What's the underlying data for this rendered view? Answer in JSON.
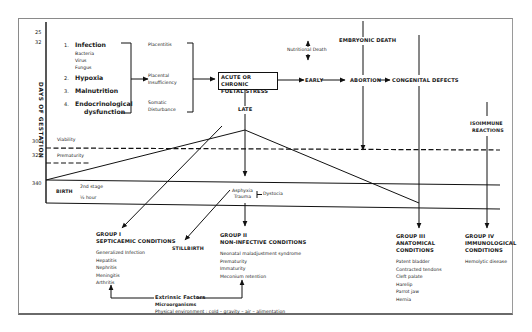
{
  "axis": {
    "label": "DAYS OF GESTATION",
    "ticks": [
      "25",
      "32",
      "300",
      "325",
      "340"
    ]
  },
  "causes": [
    {
      "num": "1.",
      "label": "Infection",
      "sub": [
        "Bacteria",
        "Virus",
        "Fungus"
      ]
    },
    {
      "num": "2.",
      "label": "Hypoxia",
      "sub": []
    },
    {
      "num": "3.",
      "label": "Malnutrition",
      "sub": []
    },
    {
      "num": "4.",
      "label": "Endocrinological",
      "label2": "dysfunction",
      "sub": []
    }
  ],
  "mechanisms": {
    "placentitis": "Placentitis",
    "placental_1": "Placental",
    "placental_2": "Insufficiency",
    "somatic_1": "Somatic",
    "somatic_2": "Disturbance"
  },
  "stress_box": {
    "line1": "ACUTE OR CHRONIC",
    "line2": "FOETAL STRESS"
  },
  "flow": {
    "nutritional_death": "Nutritional Death",
    "embryonic_death": "EMBRYONIC DEATH",
    "early": "EARLY",
    "abortion": "ABORTION",
    "congenital_defects": "CONGENITAL DEFECTS",
    "late": "LATE",
    "isoimmune_1": "ISOIMMUNE",
    "isoimmune_2": "REACTIONS",
    "asphyxia": "Asphyxia",
    "trauma": "Trauma",
    "dystocia": "Dystocia",
    "stillbirth": "STILLBIRTH"
  },
  "timeline": {
    "viability": "Viability",
    "prematurity": "Prematurity",
    "birth": "BIRTH",
    "second_stage": "2nd stage",
    "half_hour": "½ hour"
  },
  "groups": [
    {
      "title": "GROUP I",
      "subtitle": "SEPTICAEMIC CONDITIONS",
      "items": [
        "Generalized Infection",
        "Hepatitis",
        "Nephritis",
        "Meningitis",
        "Arthritis"
      ]
    },
    {
      "title": "GROUP II",
      "subtitle": "NON-INFECTIVE CONDITIONS",
      "items": [
        "Neonatal maladjustment syndrome",
        "Prematurity",
        "Immaturity",
        "Meconium retention"
      ]
    },
    {
      "title": "GROUP III",
      "subtitle": "ANATOMICAL",
      "subtitle2": "CONDITIONS",
      "items": [
        "Patent bladder",
        "Contracted tendons",
        "Cleft palate",
        "Harelip",
        "Parrot jaw",
        "Hernia"
      ]
    },
    {
      "title": "GROUP IV",
      "subtitle": "IMMUNOLOGICAL",
      "subtitle2": "CONDITIONS",
      "items": [
        "Hemolytic disease"
      ]
    }
  ],
  "extrinsic": {
    "title": "Extrinsic Factors",
    "line1": "Microorganisms",
    "line2": "Physical environment :  cold – gravity – air – alimentation"
  }
}
